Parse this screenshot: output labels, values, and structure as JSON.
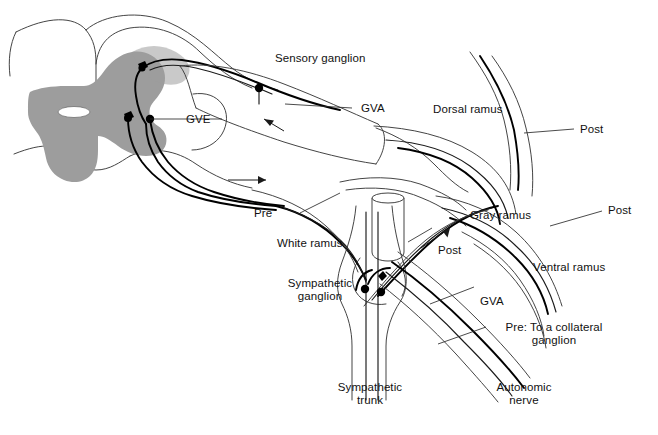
{
  "figure": {
    "background_color": "#ffffff",
    "line_color": "#1a1a1a",
    "gray_matter_color": "#9d9d9d",
    "canal_color": "#ffffff"
  },
  "labels": {
    "sensory_ganglion": "Sensory ganglion",
    "gve": "GVE",
    "gva_upper": "GVA",
    "dorsal_ramus": "Dorsal ramus",
    "post_dorsal": "Post",
    "post_ventral": "Post",
    "post_gray": "Post",
    "gray_ramus": "Gray ramus",
    "ventral_ramus": "Ventral ramus",
    "pre": "Pre",
    "white_ramus": "White ramus",
    "sympathetic_ganglion_line1": "Sympathetic",
    "sympathetic_ganglion_line2": "ganglion",
    "gva_lower": "GVA",
    "pre_collateral_line1": "Pre: To a collateral",
    "pre_collateral_line2": "ganglion",
    "sympathetic_trunk_line1": "Sympathetic",
    "sympathetic_trunk_line2": "trunk",
    "autonomic_nerve_line1": "Autonomic",
    "autonomic_nerve_line2": "nerve"
  },
  "structures": {
    "spinal_cord": "spinal-cord-cross-section",
    "gray_matter": "gray-matter-butterfly",
    "central_canal": "central-canal",
    "dorsal_root": "dorsal-root",
    "ventral_root": "ventral-root",
    "spinal_nerve": "spinal-nerve-trunk",
    "cut_nerve_stump": "cut-nerve-stump",
    "sympathetic_chain": "sympathetic-chain"
  },
  "neuron_bodies": {
    "cord_count": 3,
    "sensory_ganglion_count": 1,
    "sympathetic_ganglion_count": 2
  },
  "flow_arrows": {
    "count": 4,
    "directions": [
      "afferent-toward-cord",
      "efferent-away-from-cord",
      "gray-ramus-outward",
      "post-ganglionic"
    ]
  }
}
